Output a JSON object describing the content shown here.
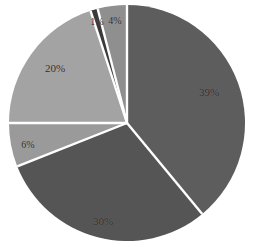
{
  "chart_data": {
    "type": "pie",
    "title": "",
    "subtitle": "",
    "xlabel": "",
    "ylabel": "",
    "grid": false,
    "legend": "none",
    "background_color": "#ffffff",
    "separator_color": "#ffffff",
    "label_color": "#2b2b2b",
    "start_angle_deg": -90,
    "direction": "clockwise",
    "center": {
      "x": 127,
      "y": 123
    },
    "radius": 118,
    "categories": [
      "39%",
      "30%",
      "6%",
      "20%",
      "1%",
      "4%"
    ],
    "values": [
      39,
      30,
      6,
      20,
      1,
      4
    ],
    "slices": [
      {
        "label": "39%",
        "value": 39,
        "color": "#5d5d5d",
        "label_x": 209,
        "label_y": 92
      },
      {
        "label": "30%",
        "value": 30,
        "color": "#555555",
        "label_x": 103,
        "label_y": 221
      },
      {
        "label": "6%",
        "value": 6,
        "color": "#9a9a9a",
        "label_x": 28,
        "label_y": 145
      },
      {
        "label": "20%",
        "value": 20,
        "color": "#a3a3a3",
        "label_x": 55,
        "label_y": 68
      },
      {
        "label": "1%",
        "value": 1,
        "color": "#3a3a3a",
        "label_x": 97,
        "label_y": 22
      },
      {
        "label": "4%",
        "value": 4,
        "color": "#8f8f8f",
        "label_x": 115,
        "label_y": 21
      }
    ]
  }
}
